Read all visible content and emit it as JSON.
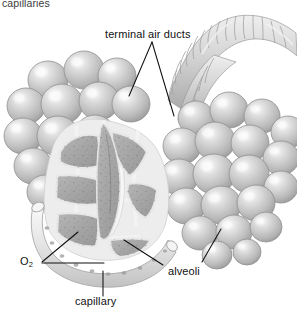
{
  "figure": {
    "type": "anatomical-illustration",
    "style": "grayscale pencil / airbrush rendering on white background",
    "background_color": "#ffffff",
    "line_color": "#111111",
    "palette": {
      "alveoli_sphere_light": "#f2f2f2",
      "alveoli_sphere_mid": "#c6c6c6",
      "alveoli_sphere_shadow": "#9d9d9d",
      "cut_tissue_fill": "#a9a9a9",
      "cut_tissue_speckle": "#6d6d6d",
      "septa_wall": "#ededed",
      "duct_band_light": "#e6e6e6",
      "duct_band_dark": "#bdbdbd",
      "capillary_fill": "#e4e4e4"
    }
  },
  "labels": {
    "clipped_top": {
      "text": "capillaries",
      "note": "cut off at top edge of image"
    },
    "terminal_air_ducts": {
      "text": "terminal air ducts"
    },
    "alveoli": {
      "text": "alveoli"
    },
    "capillary": {
      "text": "capillary"
    },
    "oxygen": {
      "text": "O",
      "subscript": "2"
    }
  },
  "structures": [
    {
      "name": "left-alveolar-cluster",
      "description": "grape-like cluster of rounded alveoli, upper left"
    },
    {
      "name": "right-alveolar-cluster",
      "description": "grape-like cluster of rounded alveoli, right"
    },
    {
      "name": "terminal-air-duct-branch",
      "description": "ribbed Y-shaped bronchiole branching at top right"
    },
    {
      "name": "cutaway-cross-section",
      "description": "sectioned alveolar sac showing central air duct and speckled septa"
    },
    {
      "name": "capillary-network",
      "description": "curved capillary vessel wrapping beneath the cut alveolar sac"
    }
  ]
}
